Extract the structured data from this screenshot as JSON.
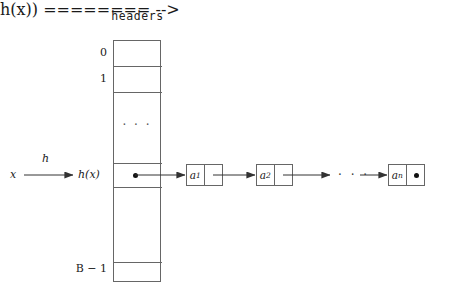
{
  "diagram": {
    "title": "headers",
    "table": {
      "name": "headers",
      "left_labels": [
        "0",
        "1",
        "h(x)",
        "B - 1"
      ],
      "rows": [
        {
          "label": "0",
          "kind": "bucket",
          "content": ""
        },
        {
          "label": "1",
          "kind": "bucket",
          "content": ""
        },
        {
          "label": "",
          "kind": "ellipsis",
          "content": "· · ·"
        },
        {
          "label": "h(x)",
          "kind": "bucket",
          "content": "•"
        },
        {
          "label": "",
          "kind": "bucket",
          "content": ""
        },
        {
          "label": "B − 1",
          "kind": "bucket",
          "content": ""
        }
      ],
      "first_index": "0",
      "second_index": "1",
      "hashed_index": "h(x)",
      "last_index": "B − 1",
      "vertical_ellipsis": "· · ·"
    },
    "input": {
      "key_label": "x",
      "function_label": "h",
      "result_label": "h(x)"
    },
    "chain": {
      "nodes": [
        {
          "value": "a",
          "subscript": "1",
          "next": "pointer"
        },
        {
          "value": "a",
          "subscript": "2",
          "next": "pointer"
        },
        {
          "value": "a",
          "subscript": "n",
          "next": "null"
        }
      ],
      "ellipsis": "· · ·",
      "null_marker": "•",
      "bucket_pointer_marker": "•"
    },
    "colors": {
      "stroke": "#666666",
      "text": "#1a1a1a",
      "arrow": "#333333",
      "background": "#ffffff",
      "dot": "#111111"
    }
  }
}
